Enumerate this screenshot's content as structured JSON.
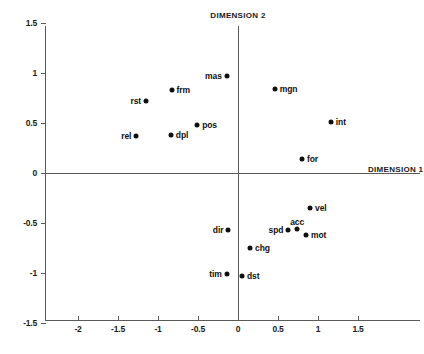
{
  "chart_data": {
    "type": "scatter",
    "title": "",
    "xlabel": "DIMENSION 1",
    "ylabel": "DIMENSION 2",
    "xlim": [
      -2.4125,
      2.275
    ],
    "ylim": [
      -1.5,
      1.5
    ],
    "grid": false,
    "legend": null,
    "xticks": [
      -2,
      -1.5,
      -1,
      -0.5,
      0,
      0.5,
      1,
      1.5
    ],
    "xticklabels": [
      "-2",
      "-1.5",
      "-1",
      "-0.5",
      "0",
      "0.5",
      "1",
      "1.5"
    ],
    "yticks": [
      -1.5,
      -1,
      -0.5,
      0,
      0.5,
      1,
      1.5
    ],
    "yticklabels": [
      "-1.5",
      "-1",
      "-0.5",
      "0",
      "0.5",
      "1",
      "1.5"
    ],
    "points": [
      {
        "label": "mas",
        "x": -0.14,
        "y": 0.97,
        "label_side": "left"
      },
      {
        "label": "frm",
        "x": -0.83,
        "y": 0.83,
        "label_side": "right"
      },
      {
        "label": "mgn",
        "x": 0.46,
        "y": 0.84,
        "label_side": "right"
      },
      {
        "label": "rst",
        "x": -1.15,
        "y": 0.72,
        "label_side": "left"
      },
      {
        "label": "int",
        "x": 1.16,
        "y": 0.51,
        "label_side": "right"
      },
      {
        "label": "pos",
        "x": -0.51,
        "y": 0.48,
        "label_side": "right"
      },
      {
        "label": "dpl",
        "x": -0.84,
        "y": 0.38,
        "label_side": "right"
      },
      {
        "label": "rel",
        "x": -1.27,
        "y": 0.37,
        "label_side": "left"
      },
      {
        "label": "for",
        "x": 0.8,
        "y": 0.14,
        "label_side": "right"
      },
      {
        "label": "vel",
        "x": 0.9,
        "y": -0.35,
        "label_side": "right"
      },
      {
        "label": "dir",
        "x": -0.12,
        "y": -0.57,
        "label_side": "left"
      },
      {
        "label": "spd",
        "x": 0.63,
        "y": -0.57,
        "label_side": "left"
      },
      {
        "label": "acc",
        "x": 0.74,
        "y": -0.56,
        "label_side": "above"
      },
      {
        "label": "mot",
        "x": 0.85,
        "y": -0.62,
        "label_side": "right"
      },
      {
        "label": "chg",
        "x": 0.15,
        "y": -0.75,
        "label_side": "right"
      },
      {
        "label": "tim",
        "x": -0.14,
        "y": -1.01,
        "label_side": "left"
      },
      {
        "label": "dst",
        "x": 0.05,
        "y": -1.03,
        "label_side": "right"
      }
    ]
  },
  "axes": {
    "dimension_2_title": "DIMENSION 2",
    "dimension_1_title": "DIMENSION 1"
  },
  "colors": {
    "point": "#101010",
    "axis": "#5a5a5a",
    "text": "#1a1a1a",
    "background": "#ffffff"
  }
}
